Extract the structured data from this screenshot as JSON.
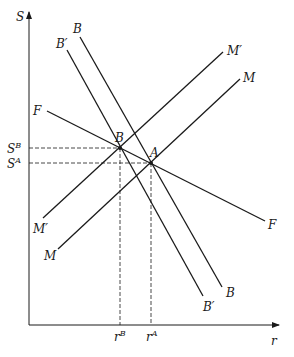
{
  "diagram": {
    "axes": {
      "y_label": "S",
      "x_label": "r",
      "origin": [
        29,
        325
      ],
      "y_top": 12,
      "x_right": 279
    },
    "colors": {
      "line": "#1a1a1a",
      "background": "#ffffff"
    },
    "curves": [
      {
        "id": "F",
        "start_label": "F",
        "end_label": "F",
        "from": [
          47,
          111
        ],
        "to": [
          265,
          221
        ]
      },
      {
        "id": "B",
        "start_label": "B",
        "end_label": "B",
        "from": [
          80,
          37
        ],
        "to": [
          222,
          287
        ]
      },
      {
        "id": "B-prime",
        "start_label": "B′",
        "end_label": "B′",
        "from": [
          67,
          50
        ],
        "to": [
          203,
          296
        ]
      },
      {
        "id": "M-prime",
        "start_label": "M′",
        "end_label": "M′",
        "from": [
          43,
          218
        ],
        "to": [
          223,
          52
        ]
      },
      {
        "id": "M",
        "start_label": "M",
        "end_label": "M",
        "from": [
          58,
          249
        ],
        "to": [
          240,
          79
        ]
      }
    ],
    "points": [
      {
        "id": "B",
        "label": "B",
        "at": [
          120,
          148
        ]
      },
      {
        "id": "A",
        "label": "A",
        "at": [
          151,
          163
        ]
      }
    ],
    "ticks": {
      "S_B": {
        "base": "S",
        "sup": "B"
      },
      "S_A": {
        "base": "S",
        "sup": "A"
      },
      "r_B": {
        "base": "r",
        "sup": "B"
      },
      "r_A": {
        "base": "r",
        "sup": "A"
      }
    }
  }
}
